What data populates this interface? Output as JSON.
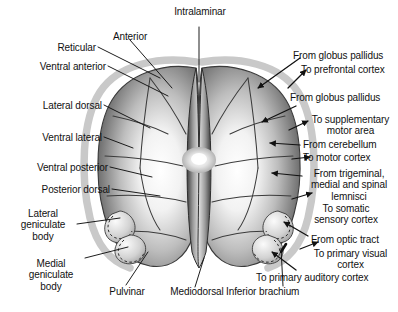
{
  "figure": {
    "type": "anatomical-diagram",
    "view": "dorsal view of both thalami",
    "background_color": "#ffffff",
    "ink_color": "#111111",
    "capsule_color": "#c9c9c9",
    "body_fill_light": "#fdfdfd",
    "body_fill_dark": "#4a4a4a"
  },
  "labels": {
    "top": [
      {
        "id": "intralaminar",
        "text": "Intralaminar",
        "align": "center"
      },
      {
        "id": "anterior",
        "text": "Anterior",
        "align": "center"
      }
    ],
    "left": [
      {
        "id": "reticular",
        "text": "Reticular"
      },
      {
        "id": "ventral_anterior",
        "text": "Ventral anterior"
      },
      {
        "id": "lateral_dorsal",
        "text": "Lateral dorsal"
      },
      {
        "id": "ventral_lateral",
        "text": "Ventral lateral"
      },
      {
        "id": "ventral_posterior",
        "text": "Ventral posterior"
      },
      {
        "id": "posterior_dorsal",
        "text": "Posterior dorsal"
      },
      {
        "id": "lateral_geniculate_body",
        "text": "Lateral\ngeniculate\nbody"
      },
      {
        "id": "medial_geniculate_body",
        "text": "Medial\ngeniculate\nbody"
      }
    ],
    "bottom": [
      {
        "id": "pulvinar",
        "text": "Pulvinar"
      },
      {
        "id": "mediodorsal",
        "text": "Mediodorsal"
      },
      {
        "id": "inferior_brachium",
        "text": "Inferior brachium"
      }
    ],
    "right": [
      {
        "id": "from_globus_pallidus_1",
        "text": "From globus pallidus",
        "direction": "afferent"
      },
      {
        "id": "to_prefrontal_cortex",
        "text": "To prefrontal cortex",
        "direction": "efferent"
      },
      {
        "id": "from_globus_pallidus_2",
        "text": "From globus pallidus",
        "direction": "afferent"
      },
      {
        "id": "to_supplementary_motor_area",
        "text": "To supplementary\nmotor area",
        "direction": "efferent"
      },
      {
        "id": "from_cerebellum",
        "text": "From cerebellum",
        "direction": "afferent"
      },
      {
        "id": "to_motor_cortex",
        "text": "To motor cortex",
        "direction": "efferent"
      },
      {
        "id": "from_trigeminal_lemnisci",
        "text": "From trigeminal,\nmedial and spinal\nlemnisci",
        "direction": "afferent"
      },
      {
        "id": "to_somatic_sensory_cortex",
        "text": "To somatic\nsensory cortex",
        "direction": "efferent"
      },
      {
        "id": "from_optic_tract",
        "text": "From optic tract",
        "direction": "afferent"
      },
      {
        "id": "to_primary_visual_cortex",
        "text": "To primary visual\ncortex",
        "direction": "efferent"
      },
      {
        "id": "to_primary_auditory_cortex",
        "text": "To primary auditory cortex",
        "direction": "efferent"
      }
    ]
  }
}
